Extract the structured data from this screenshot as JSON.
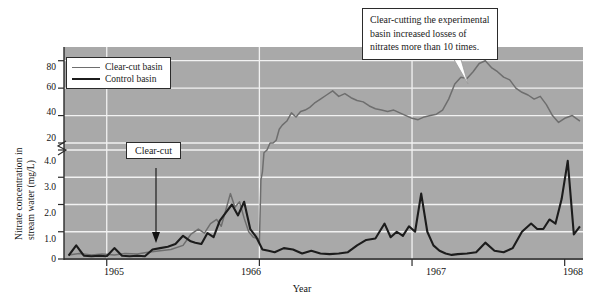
{
  "figure": {
    "background_color": "#a9a9a9",
    "gridline_color": "#f2f2f2",
    "axis_color": "#2b2b2b"
  },
  "axes": {
    "y_label_line1": "Nitrate concentration in",
    "y_label_line2": "stream water (mg/L)",
    "y_ticks_upper": [
      "80",
      "60",
      "40",
      "20"
    ],
    "y_ticks_lower": [
      "4.0",
      "3.0",
      "2.0",
      "1.0",
      "0"
    ],
    "y_axis_break": true,
    "x_label": "Year",
    "x_ticks": [
      "1965",
      "1966",
      "1967",
      "1968"
    ]
  },
  "legend": {
    "clear_cut_label": "Clear-cut basin",
    "clear_cut_color": "#6e6e6e",
    "control_label": "Control basin",
    "control_color": "#1c1c1c"
  },
  "annotations": {
    "clear_cut_marker": "Clear-cut",
    "callout_line1": "Clear-cutting the experimental",
    "callout_line2": "basin increased losses of",
    "callout_line3": "nitrates more than 10 times."
  },
  "chart_data": {
    "type": "line",
    "title": "",
    "xlabel": "Year",
    "ylabel": "Nitrate concentration in stream water (mg/L)",
    "xlim": [
      1964.72,
      1968.12
    ],
    "ylim": [
      0,
      90
    ],
    "y_axis_broken": true,
    "y_break_lower_range": [
      0,
      4.0
    ],
    "y_break_upper_range": [
      20,
      90
    ],
    "grid": true,
    "legend_position": "upper-left-inside",
    "series": [
      {
        "name": "Clear-cut basin",
        "color": "#6e6e6e",
        "x": [
          1964.75,
          1964.82,
          1964.9,
          1964.97,
          1965.05,
          1965.12,
          1965.2,
          1965.27,
          1965.35,
          1965.42,
          1965.5,
          1965.55,
          1965.6,
          1965.64,
          1965.68,
          1965.72,
          1965.75,
          1965.78,
          1965.81,
          1965.84,
          1965.87,
          1965.9,
          1965.93,
          1965.96,
          1965.99,
          1966.0,
          1966.01,
          1966.02,
          1966.03,
          1966.05,
          1966.07,
          1966.09,
          1966.11,
          1966.13,
          1966.15,
          1966.18,
          1966.21,
          1966.24,
          1966.27,
          1966.3,
          1966.33,
          1966.36,
          1966.4,
          1966.44,
          1966.48,
          1966.52,
          1966.56,
          1966.6,
          1966.64,
          1966.68,
          1966.72,
          1966.76,
          1966.8,
          1966.84,
          1966.88,
          1966.92,
          1966.96,
          1967.0,
          1967.04,
          1967.08,
          1967.12,
          1967.16,
          1967.2,
          1967.24,
          1967.28,
          1967.32,
          1967.36,
          1967.4,
          1967.44,
          1967.48,
          1967.52,
          1967.56,
          1967.6,
          1967.64,
          1967.68,
          1967.72,
          1967.76,
          1967.8,
          1967.84,
          1967.88,
          1967.92,
          1967.96,
          1968.0,
          1968.05,
          1968.1
        ],
        "y": [
          0.15,
          0.2,
          0.15,
          0.18,
          0.15,
          0.2,
          0.18,
          0.25,
          0.3,
          0.35,
          0.5,
          0.9,
          1.1,
          0.95,
          1.3,
          1.45,
          1.2,
          1.8,
          2.4,
          1.9,
          2.1,
          1.5,
          1.0,
          0.8,
          0.75,
          0.6,
          2.9,
          3.2,
          3.9,
          4.0,
          12,
          18,
          22,
          30,
          33,
          36,
          42,
          39,
          43,
          44,
          46,
          49,
          52,
          55,
          58,
          54,
          56,
          53,
          51,
          50,
          47,
          45,
          44,
          43,
          44,
          42,
          40,
          38,
          37,
          39,
          40,
          41,
          44,
          52,
          63,
          68,
          67,
          72,
          78,
          80,
          75,
          72,
          68,
          66,
          60,
          57,
          55,
          52,
          54,
          48,
          40,
          35,
          38,
          40,
          36
        ]
      },
      {
        "name": "Control basin",
        "color": "#1c1c1c",
        "x": [
          1964.75,
          1964.8,
          1964.85,
          1964.9,
          1964.95,
          1965.0,
          1965.05,
          1965.1,
          1965.15,
          1965.2,
          1965.25,
          1965.3,
          1965.35,
          1965.4,
          1965.45,
          1965.5,
          1965.55,
          1965.58,
          1965.62,
          1965.66,
          1965.7,
          1965.74,
          1965.78,
          1965.82,
          1965.86,
          1965.9,
          1965.94,
          1965.98,
          1966.02,
          1966.06,
          1966.1,
          1966.16,
          1966.22,
          1966.28,
          1966.34,
          1966.4,
          1966.46,
          1966.52,
          1966.58,
          1966.64,
          1966.7,
          1966.76,
          1966.82,
          1966.86,
          1966.9,
          1966.94,
          1966.98,
          1967.02,
          1967.06,
          1967.1,
          1967.14,
          1967.18,
          1967.22,
          1967.26,
          1967.3,
          1967.36,
          1967.42,
          1967.48,
          1967.54,
          1967.6,
          1967.66,
          1967.72,
          1967.78,
          1967.82,
          1967.86,
          1967.9,
          1967.94,
          1967.98,
          1968.02,
          1968.06,
          1968.1
        ],
        "y": [
          0.12,
          0.5,
          0.12,
          0.1,
          0.12,
          0.1,
          0.4,
          0.12,
          0.1,
          0.12,
          0.1,
          0.35,
          0.4,
          0.45,
          0.55,
          0.85,
          0.65,
          0.6,
          0.55,
          0.95,
          0.8,
          1.4,
          1.7,
          2.0,
          1.6,
          2.1,
          1.1,
          0.8,
          0.35,
          0.3,
          0.25,
          0.4,
          0.35,
          0.2,
          0.3,
          0.2,
          0.18,
          0.2,
          0.25,
          0.5,
          0.7,
          0.75,
          1.3,
          0.8,
          1.0,
          0.85,
          1.2,
          1.0,
          2.4,
          1.0,
          0.5,
          0.3,
          0.2,
          0.15,
          0.18,
          0.2,
          0.25,
          0.6,
          0.3,
          0.25,
          0.4,
          1.0,
          1.3,
          1.1,
          1.1,
          1.45,
          1.3,
          2.2,
          3.6,
          0.9,
          1.2
        ]
      }
    ]
  }
}
